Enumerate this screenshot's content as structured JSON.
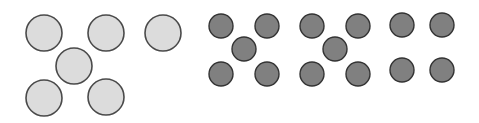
{
  "colors": {
    "background": "#ffffff",
    "light_fill": "#dcdcdc",
    "light_stroke": "#4a4a4a",
    "dark_fill": "#808080",
    "dark_stroke": "#333333"
  },
  "groups": [
    {
      "name": "light-circle-group",
      "radius": 18,
      "style": "light",
      "circles": [
        [
          44,
          33
        ],
        [
          106,
          33
        ],
        [
          163,
          33
        ],
        [
          74,
          66
        ],
        [
          44,
          98
        ],
        [
          106,
          97
        ]
      ]
    },
    {
      "name": "dark-circle-group-1",
      "radius": 12,
      "style": "dark",
      "circles": [
        [
          221,
          26
        ],
        [
          267,
          26
        ],
        [
          244,
          49
        ],
        [
          221,
          74
        ],
        [
          267,
          74
        ]
      ]
    },
    {
      "name": "dark-circle-group-2",
      "radius": 12,
      "style": "dark",
      "circles": [
        [
          312,
          26
        ],
        [
          358,
          26
        ],
        [
          335,
          49
        ],
        [
          312,
          74
        ],
        [
          358,
          74
        ]
      ]
    },
    {
      "name": "dark-circle-group-3",
      "radius": 12,
      "style": "dark",
      "circles": [
        [
          402,
          25
        ],
        [
          442,
          25
        ],
        [
          402,
          70
        ],
        [
          442,
          70
        ]
      ]
    }
  ]
}
